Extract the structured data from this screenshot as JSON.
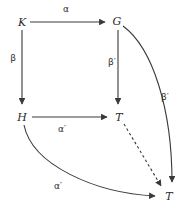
{
  "diagram": {
    "type": "commutative-diagram",
    "stroke_color": "#3a3a3a",
    "label_color": "#2b2b2b",
    "background": "#ffffff",
    "nodes": [
      {
        "id": "K",
        "label": "K",
        "x": 22,
        "y": 22
      },
      {
        "id": "G",
        "label": "G",
        "x": 117,
        "y": 21
      },
      {
        "id": "H",
        "label": "H",
        "x": 22,
        "y": 117
      },
      {
        "id": "T1",
        "label": "T",
        "x": 119,
        "y": 117
      },
      {
        "id": "T2",
        "label": "T",
        "x": 169,
        "y": 196
      }
    ],
    "edges": [
      {
        "id": "K-to-G",
        "from": "K",
        "to": "G",
        "label": "α",
        "label_x": 66,
        "label_y": 9,
        "style": "solid",
        "shape": "straight"
      },
      {
        "id": "K-to-H",
        "from": "K",
        "to": "H",
        "label": "β",
        "label_x": 13,
        "label_y": 58,
        "style": "solid",
        "shape": "straight"
      },
      {
        "id": "G-to-T1",
        "from": "G",
        "to": "T1",
        "label": "β′",
        "label_x": 112,
        "label_y": 62,
        "style": "solid",
        "shape": "straight"
      },
      {
        "id": "H-to-T1",
        "from": "H",
        "to": "T1",
        "label": "α′",
        "label_x": 62,
        "label_y": 129,
        "style": "solid",
        "shape": "straight"
      },
      {
        "id": "G-to-T2",
        "from": "G",
        "to": "T2",
        "label": "β′",
        "label_x": 165,
        "label_y": 97,
        "style": "solid",
        "shape": "curved"
      },
      {
        "id": "H-to-T2",
        "from": "H",
        "to": "T2",
        "label": "α′",
        "label_x": 58,
        "label_y": 186,
        "style": "solid",
        "shape": "curved"
      },
      {
        "id": "T1-to-T2",
        "from": "T1",
        "to": "T2",
        "label": "",
        "label_x": 0,
        "label_y": 0,
        "style": "dashed",
        "shape": "straight"
      }
    ]
  }
}
